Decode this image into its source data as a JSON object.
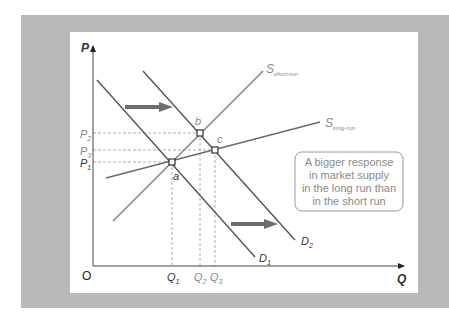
{
  "diagram": {
    "title": "",
    "axes": {
      "y_label": "P",
      "x_label": "Q",
      "origin_label": "O"
    },
    "price_labels": [
      {
        "main": "P",
        "sub": "2"
      },
      {
        "main": "P",
        "sub": "3"
      },
      {
        "main": "P",
        "sub": "1"
      }
    ],
    "quantity_labels": [
      {
        "main": "Q",
        "sub": "1"
      },
      {
        "main": "Q",
        "sub": "2"
      },
      {
        "main": "Q",
        "sub": "3"
      }
    ],
    "curves": {
      "demand_1": {
        "main": "D",
        "sub": "1"
      },
      "demand_2": {
        "main": "D",
        "sub": "2"
      },
      "supply_short_run": {
        "main": "S",
        "sub": "short-run"
      },
      "supply_long_run": {
        "main": "S",
        "sub": "long-run"
      }
    },
    "points": {
      "a": "a",
      "b": "b",
      "c": "c"
    },
    "annotation": {
      "lines": [
        "A bigger response",
        "in market supply",
        "in the long run than",
        "in the short run"
      ]
    },
    "colors": {
      "frame": "#b9b9b9",
      "panel": "#ffffff",
      "axis": "#444444",
      "curve": "#5a5a5a",
      "supply": "#7a7a7a",
      "arrow": "#6e6e6e",
      "dashed": "#9a9a9a",
      "label_gray": "#888888"
    }
  }
}
